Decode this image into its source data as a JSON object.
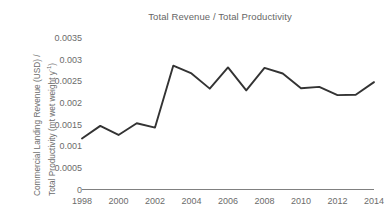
{
  "chart_data": {
    "type": "line",
    "title": "Total Revenue / Total Productivity",
    "xlabel": "",
    "ylabel": "Commercial Landing Revenue (USD) / Total Productivity (mt wet weight y-1)",
    "ylabel_line1": "Commercial Landing Revenue (USD) /",
    "ylabel_line2": "Total Productivity (mt wet weight y",
    "ylabel_exponent": "-1",
    "ylabel_line2_end": ")",
    "x": [
      1998,
      1999,
      2000,
      2001,
      2002,
      2003,
      2004,
      2005,
      2006,
      2007,
      2008,
      2009,
      2010,
      2011,
      2012,
      2013,
      2014
    ],
    "values": [
      0.00118,
      0.00147,
      0.00126,
      0.00153,
      0.00143,
      0.00286,
      0.00268,
      0.00233,
      0.00282,
      0.00229,
      0.00281,
      0.00268,
      0.00234,
      0.00237,
      0.00218,
      0.00219,
      0.00248
    ],
    "series": [
      {
        "name": "Total Revenue / Total Productivity",
        "values": [
          0.00118,
          0.00147,
          0.00126,
          0.00153,
          0.00143,
          0.00286,
          0.00268,
          0.00233,
          0.00282,
          0.00229,
          0.00281,
          0.00268,
          0.00234,
          0.00237,
          0.00218,
          0.00219,
          0.00248
        ]
      }
    ],
    "ylim": [
      0,
      0.0035
    ],
    "xlim": [
      1998,
      2014
    ],
    "yticks": [
      0,
      0.0005,
      0.001,
      0.0015,
      0.002,
      0.0025,
      0.003,
      0.0035
    ],
    "ytick_labels": [
      "0",
      "0.0005",
      "0.001",
      "0.0015",
      "0.002",
      "0.0025",
      "0.003",
      "0.0035"
    ],
    "xticks": [
      1998,
      2000,
      2002,
      2004,
      2006,
      2008,
      2010,
      2012,
      2014
    ],
    "xtick_labels": [
      "1998",
      "2000",
      "2002",
      "2004",
      "2006",
      "2008",
      "2010",
      "2012",
      "2014"
    ],
    "grid": false,
    "legend": "none",
    "line_color": "#333333",
    "text_color": "#6b6b6b",
    "axis_color": "#808080",
    "background": "#ffffff"
  }
}
